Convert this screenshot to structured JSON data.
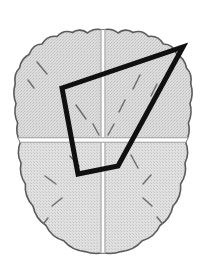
{
  "figure": {
    "title": "Axial brain schematic with quadrilateral region overlay",
    "type": "anatomical-diagram",
    "view": "axial",
    "canvas": {
      "width": 207,
      "height": 274,
      "background": "#ffffff"
    }
  },
  "colors": {
    "background": "#ffffff",
    "brain_fill": "#d6d6d6",
    "brain_fill_light": "#dedede",
    "brain_outline": "#555555",
    "sulcus_stroke": "#6e6e6e",
    "divider": "#8a8a8a",
    "gap": "#ffffff",
    "overlay_stroke": "#101010"
  },
  "brain": {
    "label": "brain-outline",
    "bounds": {
      "left": 14,
      "top": 29,
      "right": 191,
      "bottom": 253
    },
    "midline": {
      "label": "interhemispheric-fissure",
      "x": 103,
      "y_top": 31,
      "y_bottom": 252,
      "width": 3
    },
    "transverse": {
      "label": "transverse-divider",
      "y": 140,
      "x_left": 16,
      "x_right": 190,
      "height": 4
    },
    "quadrants": [
      {
        "name": "left-anterior",
        "label": "LA"
      },
      {
        "name": "right-anterior",
        "label": "RA"
      },
      {
        "name": "left-posterior",
        "label": "LP"
      },
      {
        "name": "right-posterior",
        "label": "RP"
      }
    ],
    "outline_path": "M103,29 C96,28 90,30 86,33 C82,30 76,29 71,32 C66,30 60,31 56,35 C50,34 45,37 42,42 C36,42 31,46 29,52 C24,54 20,59 19,65 C15,69 14,75 15,81 C13,87 13,94 15,100 C14,107 15,114 18,120 C17,126 18,132 21,137 L103,137 Z",
    "sulci": [
      {
        "name": "sulcus-la-1",
        "x1": 37,
        "y1": 62,
        "x2": 47,
        "y2": 74
      },
      {
        "name": "sulcus-la-2",
        "x1": 28,
        "y1": 80,
        "x2": 34,
        "y2": 88
      },
      {
        "name": "sulcus-la-3",
        "x1": 76,
        "y1": 105,
        "x2": 86,
        "y2": 119
      },
      {
        "name": "sulcus-la-4",
        "x1": 93,
        "y1": 124,
        "x2": 99,
        "y2": 135
      },
      {
        "name": "sulcus-ra-1",
        "x1": 140,
        "y1": 75,
        "x2": 133,
        "y2": 89
      },
      {
        "name": "sulcus-ra-2",
        "x1": 125,
        "y1": 100,
        "x2": 119,
        "y2": 112
      },
      {
        "name": "sulcus-ra-3",
        "x1": 114,
        "y1": 124,
        "x2": 108,
        "y2": 135
      },
      {
        "name": "sulcus-ra-4",
        "x1": 157,
        "y1": 84,
        "x2": 151,
        "y2": 96
      },
      {
        "name": "sulcus-lp-1",
        "x1": 70,
        "y1": 156,
        "x2": 79,
        "y2": 166
      },
      {
        "name": "sulcus-lp-2",
        "x1": 45,
        "y1": 176,
        "x2": 56,
        "y2": 184
      },
      {
        "name": "sulcus-lp-3",
        "x1": 62,
        "y1": 198,
        "x2": 52,
        "y2": 206
      },
      {
        "name": "sulcus-lp-4",
        "x1": 48,
        "y1": 218,
        "x2": 40,
        "y2": 228
      },
      {
        "name": "sulcus-rp-1",
        "x1": 131,
        "y1": 155,
        "x2": 138,
        "y2": 168
      },
      {
        "name": "sulcus-rp-2",
        "x1": 151,
        "y1": 175,
        "x2": 143,
        "y2": 184
      },
      {
        "name": "sulcus-rp-3",
        "x1": 143,
        "y1": 198,
        "x2": 152,
        "y2": 206
      },
      {
        "name": "sulcus-rp-4",
        "x1": 157,
        "y1": 217,
        "x2": 165,
        "y2": 227
      }
    ]
  },
  "overlay": {
    "name": "quadrilateral-region-overlay",
    "shape": "quadrilateral",
    "stroke_color": "#101010",
    "stroke_width": 5,
    "closed": true,
    "vertices": [
      {
        "name": "vertex-left",
        "x": 62,
        "y": 88
      },
      {
        "name": "vertex-apex-right",
        "x": 183,
        "y": 47
      },
      {
        "name": "vertex-lower-right",
        "x": 118,
        "y": 166
      },
      {
        "name": "vertex-lower-left",
        "x": 78,
        "y": 174
      }
    ],
    "points_string": "62,88 183,47 118,166 78,174"
  }
}
